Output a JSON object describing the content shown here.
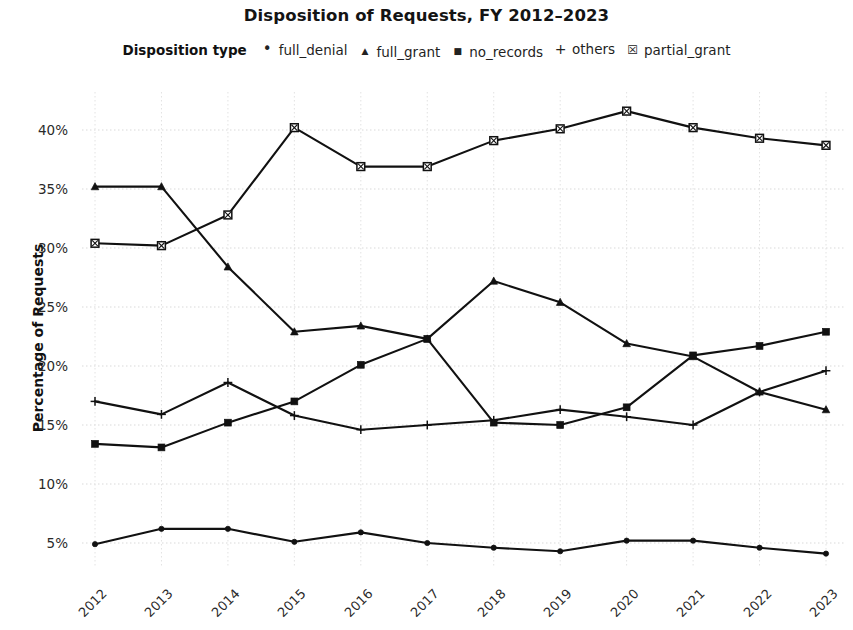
{
  "chart_data": {
    "type": "line",
    "title": "Disposition of Requests, FY 2012–2023",
    "xlabel": "",
    "ylabel": "Percentage of Requests",
    "legend_title": "Disposition type",
    "legend_position": "top-center",
    "grid": true,
    "x": [
      "2012",
      "2013",
      "2014",
      "2015",
      "2016",
      "2017",
      "2018",
      "2019",
      "2020",
      "2021",
      "2022",
      "2023"
    ],
    "categories": [
      "2012",
      "2013",
      "2014",
      "2015",
      "2016",
      "2017",
      "2018",
      "2019",
      "2020",
      "2021",
      "2022",
      "2023"
    ],
    "ytick_labels": [
      "5%",
      "10%",
      "15%",
      "20%",
      "25%",
      "30%",
      "35%",
      "40%"
    ],
    "ytick_values": [
      5,
      10,
      15,
      20,
      25,
      30,
      35,
      40
    ],
    "ylim": [
      2.5,
      43.5
    ],
    "value_suffix": "%",
    "series": [
      {
        "name": "full_denial",
        "marker": "circle",
        "color": "#111111",
        "values": [
          4.9,
          6.2,
          6.2,
          5.1,
          5.9,
          5.0,
          4.6,
          4.3,
          5.2,
          5.2,
          4.6,
          4.1
        ]
      },
      {
        "name": "full_grant",
        "marker": "triangle",
        "color": "#111111",
        "values": [
          35.2,
          35.2,
          28.4,
          22.9,
          23.4,
          22.3,
          27.2,
          25.4,
          21.9,
          20.8,
          17.8,
          16.3
        ]
      },
      {
        "name": "no_records",
        "marker": "square",
        "color": "#111111",
        "values": [
          13.4,
          13.1,
          15.2,
          17.0,
          20.1,
          22.3,
          15.2,
          15.0,
          16.5,
          20.9,
          21.7,
          22.9
        ]
      },
      {
        "name": "others",
        "marker": "plus",
        "color": "#111111",
        "values": [
          17.0,
          15.9,
          18.6,
          15.8,
          14.6,
          15.0,
          15.4,
          16.3,
          15.7,
          15.0,
          17.8,
          19.6
        ]
      },
      {
        "name": "partial_grant",
        "marker": "crossed-square",
        "color": "#111111",
        "values": [
          30.4,
          30.2,
          32.8,
          40.2,
          36.9,
          36.9,
          39.1,
          40.1,
          41.6,
          40.2,
          39.3,
          38.7
        ]
      }
    ]
  },
  "legend": {
    "title": "Disposition type",
    "items": [
      {
        "label": "full_denial",
        "marker": "circle"
      },
      {
        "label": "full_grant",
        "marker": "triangle"
      },
      {
        "label": "no_records",
        "marker": "square"
      },
      {
        "label": "others",
        "marker": "plus"
      },
      {
        "label": "partial_grant",
        "marker": "crossed-square"
      }
    ]
  }
}
